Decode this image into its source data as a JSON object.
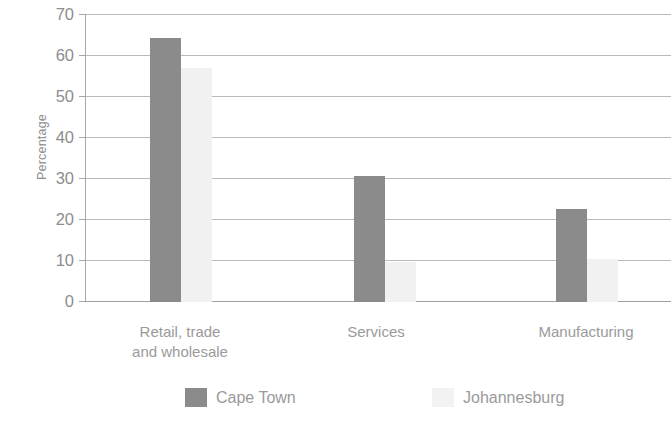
{
  "chart_data": {
    "type": "bar",
    "title": "",
    "xlabel": "",
    "ylabel": "Percentage",
    "ylim": [
      0,
      70
    ],
    "ytick_step": 10,
    "yticks": [
      "70",
      "60",
      "50",
      "40",
      "30",
      "20",
      "10",
      "0"
    ],
    "grid": true,
    "legend_position": "bottom",
    "categories": [
      "Retail, trade\nand wholesale",
      "Services",
      "Manufacturing"
    ],
    "series": [
      {
        "name": "Cape Town",
        "color": "#8b8b8b",
        "values": [
          64.5,
          30.8,
          22.8
        ]
      },
      {
        "name": "Johannesburg",
        "color": "#f1f1f1",
        "values": [
          57.0,
          9.8,
          10.5
        ]
      }
    ]
  },
  "legend": {
    "items": [
      {
        "label": "Cape Town",
        "swatch": "dark-gray-swatch"
      },
      {
        "label": "Johannesburg",
        "swatch": "light-gray-swatch"
      }
    ]
  }
}
